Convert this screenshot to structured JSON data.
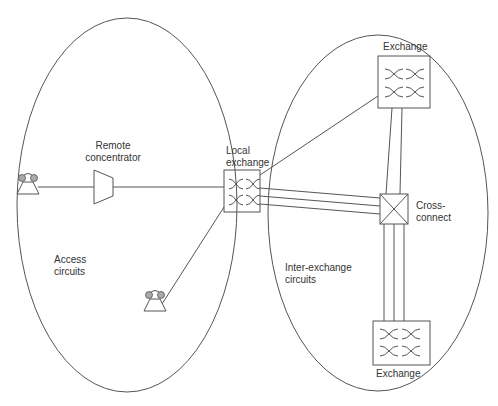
{
  "diagram": {
    "type": "telephone-network-topology",
    "colors": {
      "stroke": "#555555",
      "text": "#333333",
      "handset": "#aaaaaa",
      "background": "#ffffff"
    },
    "regions": [
      {
        "id": "access",
        "label": "Access\ncircuits"
      },
      {
        "id": "inter-exchange",
        "label": "Inter-exchange\ncircuits"
      }
    ],
    "nodes": {
      "remote_concentrator": "Remote\nconcentrator",
      "local_exchange": "Local\nexchange",
      "exchange_top": "Exchange",
      "cross_connect": "Cross-\nconnect",
      "exchange_bottom": "Exchange"
    },
    "terminals": [
      {
        "id": "telephone-1",
        "icon": "telephone-icon"
      },
      {
        "id": "telephone-2",
        "icon": "telephone-icon"
      }
    ]
  }
}
